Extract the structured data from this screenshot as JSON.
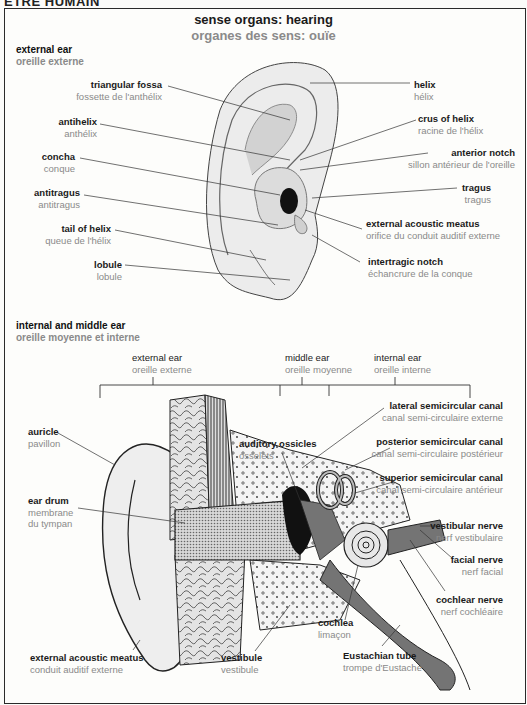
{
  "page_header": "ÊTRE HUMAIN",
  "title": {
    "en": "sense organs: hearing",
    "fr": "organes des sens: ouïe"
  },
  "external_ear_section": {
    "heading": {
      "en": "external ear",
      "fr": "oreille externe"
    },
    "labels": [
      {
        "id": "triangular-fossa",
        "en": "triangular fossa",
        "fr": "fossette de l'anthélix"
      },
      {
        "id": "antihelix",
        "en": "antihelix",
        "fr": "anthélix"
      },
      {
        "id": "concha",
        "en": "concha",
        "fr": "conque"
      },
      {
        "id": "antitragus",
        "en": "antitragus",
        "fr": "antitragus"
      },
      {
        "id": "tail-of-helix",
        "en": "tail of helix",
        "fr": "queue de l'hélix"
      },
      {
        "id": "lobule",
        "en": "lobule",
        "fr": "lobule"
      },
      {
        "id": "helix",
        "en": "helix",
        "fr": "hélix"
      },
      {
        "id": "crus-of-helix",
        "en": "crus of helix",
        "fr": "racine de l'hélix"
      },
      {
        "id": "anterior-notch",
        "en": "anterior notch",
        "fr": "sillon antérieur de l'oreille"
      },
      {
        "id": "tragus",
        "en": "tragus",
        "fr": "tragus"
      },
      {
        "id": "external-acoustic-meatus",
        "en": "external acoustic meatus",
        "fr": "orifice du conduit auditif externe"
      },
      {
        "id": "intertragic-notch",
        "en": "intertragic notch",
        "fr": "échancrure de la conque"
      }
    ]
  },
  "internal_middle_ear_section": {
    "heading": {
      "en": "internal and middle ear",
      "fr": "oreille moyenne et interne"
    },
    "divisions": [
      {
        "id": "external-ear",
        "en": "external ear",
        "fr": "oreille externe"
      },
      {
        "id": "middle-ear",
        "en": "middle ear",
        "fr": "oreille moyenne"
      },
      {
        "id": "internal-ear",
        "en": "internal ear",
        "fr": "oreille interne"
      }
    ],
    "labels": [
      {
        "id": "auricle",
        "en": "auricle",
        "fr": "pavillon"
      },
      {
        "id": "ear-drum",
        "en": "ear drum",
        "fr": "membrane",
        "fr2": "du tympan"
      },
      {
        "id": "auditory-ossicles",
        "en": "auditory ossicles",
        "fr": "osselets"
      },
      {
        "id": "lateral-semicircular-canal",
        "en": "lateral semicircular canal",
        "fr": "canal semi-circulaire externe"
      },
      {
        "id": "posterior-semicircular-canal",
        "en": "posterior semicircular canal",
        "fr": "canal semi-circulaire postérieur"
      },
      {
        "id": "superior-semicircular-canal",
        "en": "superior semicircular canal",
        "fr": "canal semi-circulaire antérieur"
      },
      {
        "id": "vestibular-nerve",
        "en": "vestibular nerve",
        "fr": "nerf vestibulaire"
      },
      {
        "id": "facial-nerve",
        "en": "facial nerve",
        "fr": "nerf facial"
      },
      {
        "id": "cochlear-nerve",
        "en": "cochlear nerve",
        "fr": "nerf cochléaire"
      },
      {
        "id": "cochlea",
        "en": "cochlea",
        "fr": "limaçon"
      },
      {
        "id": "external-acoustic-meatus-2",
        "en": "external acoustic meatus",
        "fr": "conduit auditif externe"
      },
      {
        "id": "vestibule",
        "en": "vestibule",
        "fr": "vestibule"
      },
      {
        "id": "eustachian-tube",
        "en": "Eustachian tube",
        "fr": "trompe d'Eustache"
      }
    ]
  },
  "colors": {
    "english_text": "#1a1a1a",
    "french_text": "#8a8a8a",
    "frame": "#2a2a2a",
    "background": "#fdfdfb"
  }
}
